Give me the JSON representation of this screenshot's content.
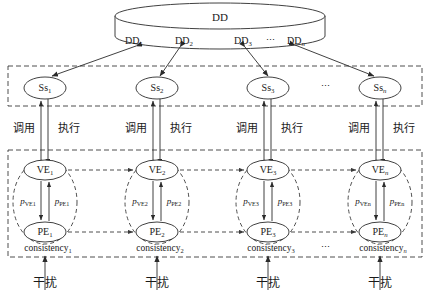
{
  "diagram": {
    "datastore": {
      "name": "datastore-cylinder",
      "label": "DD",
      "partitions": [
        "DD",
        "DD",
        "DD",
        "DD"
      ],
      "partition_subs": [
        "1",
        "2",
        "3",
        "n"
      ],
      "ellipsis": "⋯"
    },
    "service_layer": {
      "name": "service-layer",
      "nodes": [
        {
          "label": "Ss",
          "sub": "1"
        },
        {
          "label": "Ss",
          "sub": "2"
        },
        {
          "label": "Ss",
          "sub": "3"
        },
        {
          "label": "Ss",
          "sub": "n"
        }
      ],
      "ellipsis": "⋯"
    },
    "link_labels": {
      "call": "调用",
      "execute": "执行"
    },
    "entity_layer": {
      "name": "entity-layer",
      "groups": [
        {
          "ve": "VE",
          "ve_sub": "1",
          "pe": "PE",
          "pe_sub": "1",
          "p_ve": "p",
          "p_ve_sub": "VE1",
          "p_pe": "p",
          "p_pe_sub": "PE1",
          "consistency": "consistency",
          "consistency_sub": "1"
        },
        {
          "ve": "VE",
          "ve_sub": "2",
          "pe": "PE",
          "pe_sub": "2",
          "p_ve": "p",
          "p_ve_sub": "VE2",
          "p_pe": "p",
          "p_pe_sub": "PE2",
          "consistency": "consistency",
          "consistency_sub": "2"
        },
        {
          "ve": "VE",
          "ve_sub": "3",
          "pe": "PE",
          "pe_sub": "3",
          "p_ve": "p",
          "p_ve_sub": "VE3",
          "p_pe": "p",
          "p_pe_sub": "PE3",
          "consistency": "consistency",
          "consistency_sub": "3"
        },
        {
          "ve": "VE",
          "ve_sub": "n",
          "pe": "PE",
          "pe_sub": "n",
          "p_ve": "p",
          "p_ve_sub": "VEn",
          "p_pe": "p",
          "p_pe_sub": "PEn",
          "consistency": "consistency",
          "consistency_sub": "n"
        }
      ],
      "ellipsis": "⋯"
    },
    "disturbance": {
      "name": "disturbance-inputs",
      "label": "干扰",
      "count": 4
    },
    "colors": {
      "stroke": "#2b2b2b",
      "dashed": "#3a3a3a",
      "background": "#ffffff"
    }
  }
}
